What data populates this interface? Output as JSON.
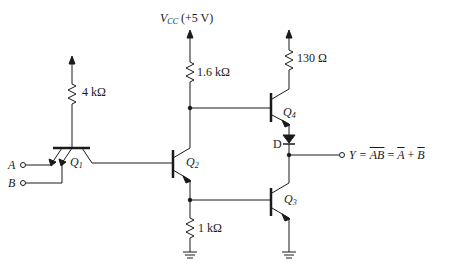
{
  "diagram": {
    "supply": {
      "symbol": "V",
      "subscript": "CC",
      "value": "(+5 V)"
    },
    "resistors": [
      {
        "id": "R1",
        "label": "4 kΩ"
      },
      {
        "id": "R2",
        "label": "1.6 kΩ"
      },
      {
        "id": "R3",
        "label": "1 kΩ"
      },
      {
        "id": "R4",
        "label": "130 Ω"
      }
    ],
    "transistors": [
      {
        "id": "Q1",
        "symbol": "Q",
        "subscript": "1",
        "type": "multi-emitter NPN"
      },
      {
        "id": "Q2",
        "symbol": "Q",
        "subscript": "2",
        "type": "NPN"
      },
      {
        "id": "Q3",
        "symbol": "Q",
        "subscript": "3",
        "type": "NPN"
      },
      {
        "id": "Q4",
        "symbol": "Q",
        "subscript": "4",
        "type": "NPN"
      }
    ],
    "diode": {
      "label": "D"
    },
    "inputs": [
      {
        "label": "A"
      },
      {
        "label": "B"
      }
    ],
    "output": {
      "lhs": "Y =",
      "nand": "AB",
      "eq": "=",
      "a_bar": "A",
      "plus": "+",
      "b_bar": "B"
    },
    "colors": {
      "line": "#1a1a1a",
      "background": "#ffffff"
    }
  }
}
